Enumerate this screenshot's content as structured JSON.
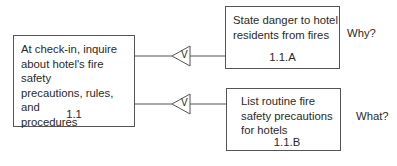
{
  "main_task": {
    "text_lines": [
      "At check-in, inquire",
      "about hotel's fire safety",
      "precautions, rules, and",
      "procedures"
    ],
    "id": "1.1"
  },
  "subtasks": [
    {
      "text_lines": [
        "State danger to hotel",
        "residents from fires"
      ],
      "id": "1.1.A",
      "question": "Why?",
      "connector_symbol": "V"
    },
    {
      "text_lines": [
        "List routine fire",
        "safety precautions",
        "for hotels"
      ],
      "id": "1.1.B",
      "question": "What?",
      "connector_symbol": "V"
    }
  ]
}
